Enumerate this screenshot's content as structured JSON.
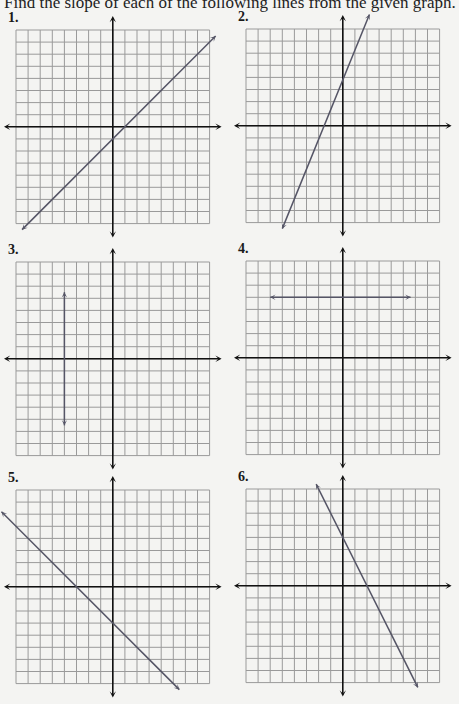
{
  "instructions": "Find the slope of each of the following lines from the given graph.",
  "grid": {
    "cols": 16,
    "rows": 16,
    "origin_col": 8,
    "origin_row": 8,
    "cell_px": 12.1,
    "grid_color": "#9a9a9a",
    "axis_color": "#111111",
    "line_color": "#555566"
  },
  "panels": [
    {
      "number": "1.",
      "left": 16,
      "top": 30,
      "line": {
        "type": "slanted",
        "p1": [
          -7.5,
          -8.5
        ],
        "p2": [
          8.5,
          7.5
        ],
        "slope": 1,
        "y_intercept": -3,
        "x_intercept": 3
      }
    },
    {
      "number": "2.",
      "left": 246,
      "top": 29,
      "line": {
        "type": "slanted",
        "p1": [
          -5.0,
          -8.5
        ],
        "p2": [
          2.2,
          9.2
        ],
        "slope": 2,
        "y_intercept": 4,
        "x_intercept": -2
      }
    },
    {
      "number": "3.",
      "left": 16,
      "top": 262,
      "line": {
        "type": "vertical",
        "x": -4,
        "y1": 5.5,
        "y2": -5.5,
        "slope": "undefined"
      }
    },
    {
      "number": "4.",
      "left": 246,
      "top": 261,
      "line": {
        "type": "horizontal",
        "y": 5,
        "x1": -6,
        "x2": 5.6,
        "slope": 0
      }
    },
    {
      "number": "5.",
      "left": 16,
      "top": 490,
      "line": {
        "type": "slanted",
        "p1": [
          -9.2,
          6.2
        ],
        "p2": [
          5.5,
          -8.5
        ],
        "slope": -1,
        "y_intercept": -3,
        "x_intercept": -3
      }
    },
    {
      "number": "6.",
      "left": 246,
      "top": 489,
      "line": {
        "type": "slanted",
        "p1": [
          -2.2,
          8.4
        ],
        "p2": [
          6.2,
          -8.4
        ],
        "slope": -2,
        "y_intercept": 4,
        "x_intercept": 2
      }
    }
  ],
  "chart_data": [
    {
      "type": "line",
      "title": "1.",
      "xlim": [
        -8,
        8
      ],
      "ylim": [
        -8,
        8
      ],
      "grid": true,
      "series": [
        {
          "name": "line 1",
          "x": [
            -5,
            3
          ],
          "y": [
            -8,
            0
          ]
        }
      ],
      "slope": 1
    },
    {
      "type": "line",
      "title": "2.",
      "xlim": [
        -8,
        8
      ],
      "ylim": [
        -8,
        8
      ],
      "grid": true,
      "series": [
        {
          "name": "line 2",
          "x": [
            -2,
            0
          ],
          "y": [
            0,
            4
          ]
        }
      ],
      "slope": 2
    },
    {
      "type": "line",
      "title": "3.",
      "xlim": [
        -8,
        8
      ],
      "ylim": [
        -8,
        8
      ],
      "grid": true,
      "series": [
        {
          "name": "line 3",
          "x": [
            -4,
            -4
          ],
          "y": [
            5.5,
            -5.5
          ]
        }
      ],
      "slope": "undefined"
    },
    {
      "type": "line",
      "title": "4.",
      "xlim": [
        -8,
        8
      ],
      "ylim": [
        -8,
        8
      ],
      "grid": true,
      "series": [
        {
          "name": "line 4",
          "x": [
            -6,
            5.6
          ],
          "y": [
            5,
            5
          ]
        }
      ],
      "slope": 0
    },
    {
      "type": "line",
      "title": "5.",
      "xlim": [
        -8,
        8
      ],
      "ylim": [
        -8,
        8
      ],
      "grid": true,
      "series": [
        {
          "name": "line 5",
          "x": [
            -3,
            0
          ],
          "y": [
            0,
            -3
          ]
        }
      ],
      "slope": -1
    },
    {
      "type": "line",
      "title": "6.",
      "xlim": [
        -8,
        8
      ],
      "ylim": [
        -8,
        8
      ],
      "grid": true,
      "series": [
        {
          "name": "line 6",
          "x": [
            0,
            2
          ],
          "y": [
            4,
            0
          ]
        }
      ],
      "slope": -2
    }
  ]
}
